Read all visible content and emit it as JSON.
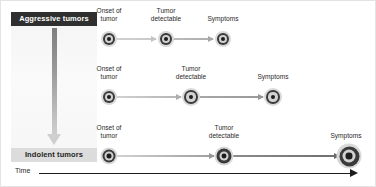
{
  "figure": {
    "background": "#ffffff",
    "width": 376,
    "height": 187
  },
  "spectrum": {
    "top_label": "Aggressive tumors",
    "bottom_label": "Indolent tumors",
    "top_label_bg": "#2f2f2f",
    "top_label_color": "#ffffff",
    "bottom_label_bg": "#dcdcdc",
    "bottom_label_color": "#242424",
    "arrow_direction": "down",
    "arrow_gradient_from": "#7e7e7e",
    "arrow_gradient_to": "#cfcfcf"
  },
  "axis": {
    "label": "Time",
    "direction": "right",
    "color": "#1c1c1c"
  },
  "rows": [
    {
      "name": "aggressive-tumor-row",
      "y": 38,
      "label_y": 6,
      "stages": [
        {
          "label": "Onset of\ntumor",
          "x": 108,
          "size": 16,
          "label_x": 108
        },
        {
          "label": "Tumor\ndetectable",
          "x": 165,
          "size": 16,
          "label_x": 165
        },
        {
          "label": "Symptoms",
          "x": 222,
          "size": 16,
          "label_x": 222,
          "label_lines": 1
        }
      ],
      "connectors": [
        {
          "from": 108,
          "to": 165,
          "color_from": "#d2d2d2",
          "color_to": "#c9c9c9",
          "head_color": "#c4c4c4"
        },
        {
          "from": 165,
          "to": 222,
          "color_from": "#bdbdbd",
          "color_to": "#adadad",
          "head_color": "#a8a8a8"
        }
      ]
    },
    {
      "name": "intermediate-tumor-row",
      "y": 96,
      "label_y": 64,
      "stages": [
        {
          "label": "Onset of\ntumor",
          "x": 108,
          "size": 16,
          "label_x": 108
        },
        {
          "label": "Tumor\ndetectable",
          "x": 190,
          "size": 18,
          "label_x": 190
        },
        {
          "label": "Symptoms",
          "x": 272,
          "size": 18,
          "label_x": 272,
          "label_lines": 1
        }
      ],
      "connectors": [
        {
          "from": 108,
          "to": 190,
          "color_from": "#d4d4d4",
          "color_to": "#b4b4b4",
          "head_color": "#aeaeae"
        },
        {
          "from": 190,
          "to": 272,
          "color_from": "#a8a8a8",
          "color_to": "#9a9a9a",
          "head_color": "#969696"
        }
      ]
    },
    {
      "name": "indolent-tumor-row",
      "y": 155,
      "label_y": 123,
      "stages": [
        {
          "label": "Onset of\ntumor",
          "x": 108,
          "size": 17,
          "label_x": 108
        },
        {
          "label": "Tumor\ndetectable",
          "x": 223,
          "size": 19,
          "label_x": 223
        },
        {
          "label": "Symptoms",
          "x": 348,
          "size": 25,
          "label_x": 345,
          "label_lines": 1
        }
      ],
      "connectors": [
        {
          "from": 108,
          "to": 223,
          "color_from": "#d6d6d6",
          "color_to": "#9d9d9d",
          "head_color": "#989898"
        },
        {
          "from": 223,
          "to": 348,
          "color_from": "#8e8e8e",
          "color_to": "#6e6e6e",
          "head_color": "#6a6a6a"
        }
      ]
    }
  ]
}
